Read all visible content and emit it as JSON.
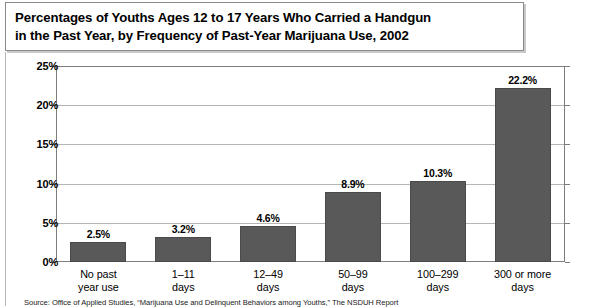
{
  "figure": {
    "title": "Percentages of Youths Ages 12 to 17 Years Who Carried a Handgun\nin the Past Year, by Frequency of Past-Year Marijuana Use, 2002",
    "source_note": "Source: Office of Applied Studies, “Marijuana Use and Delinquent Behaviors among Youths,” The NSDUH Report"
  },
  "chart_data": {
    "type": "bar",
    "title": "Percentages of Youths Ages 12 to 17 Years Who Carried a Handgun in the Past Year, by Frequency of Past-Year Marijuana Use, 2002",
    "xlabel": "",
    "ylabel": "",
    "categories": [
      "No past\nyear use",
      "1–11\ndays",
      "12–49\ndays",
      "50–99\ndays",
      "100–299\ndays",
      "300 or more\ndays"
    ],
    "values": [
      2.5,
      3.2,
      4.6,
      8.9,
      10.3,
      22.2
    ],
    "value_labels": [
      "2.5%",
      "3.2%",
      "4.6%",
      "8.9%",
      "10.3%",
      "22.2%"
    ],
    "ylim": [
      0,
      25
    ],
    "ytick_values": [
      0,
      5,
      10,
      15,
      20,
      25
    ],
    "ytick_labels": [
      "0%",
      "5%",
      "10%",
      "15%",
      "20%",
      "25%"
    ],
    "grid": true,
    "legend": "none",
    "bar_color": "#595959",
    "gridline_color": "#b5b5b5",
    "axis_color": "#7d7d7d"
  }
}
